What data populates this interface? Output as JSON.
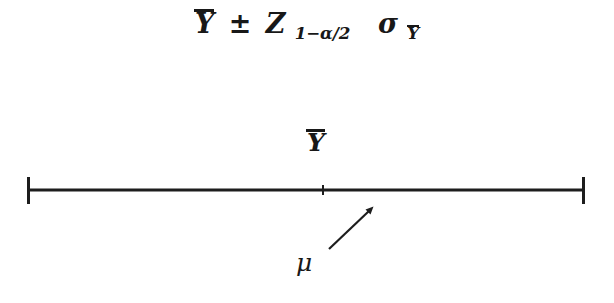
{
  "figure": {
    "type": "statistics-confidence-interval-diagram",
    "background_color": "#ffffff",
    "ink_color": "#1a1a1a"
  },
  "formula": {
    "full_text": "Ȳ ± Z₁₋α⼯₂ σȲ",
    "mean_symbol": "Y",
    "plus_minus": "±",
    "z_symbol": "Z",
    "z_subscript_prefix": "1−",
    "z_subscript_alpha": "α",
    "z_subscript_slash": "/",
    "z_subscript_two": "2",
    "sigma_symbol": "σ",
    "sigma_subscript": "Y"
  },
  "diagram": {
    "mean_label": "Y",
    "parameter_label": "μ",
    "line": {
      "x_start": 27,
      "x_end": 585,
      "y": 190,
      "stroke_width": 3,
      "color": "#1d1d1d"
    },
    "end_caps": {
      "height": 27,
      "stroke_width": 3
    },
    "center_tick": {
      "x": 323,
      "height": 9,
      "stroke_width": 2
    },
    "arrow": {
      "tail_x": 329,
      "tail_y": 249,
      "tip_x": 372,
      "tip_y": 208,
      "stroke_width": 2,
      "color": "#1d1d1d"
    }
  }
}
